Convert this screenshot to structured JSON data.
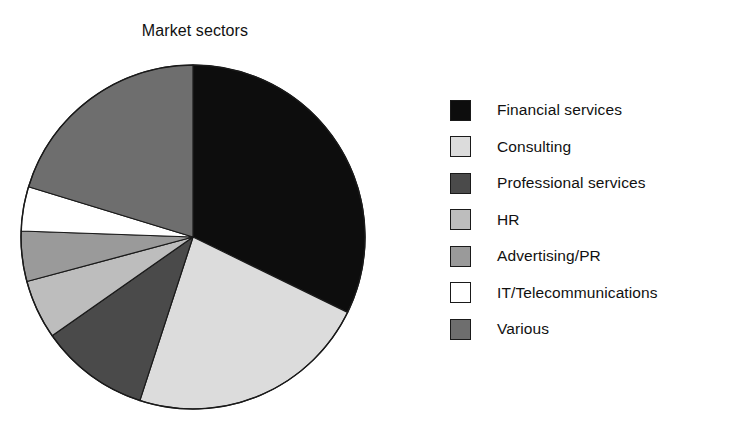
{
  "chart_data": {
    "type": "pie",
    "title": "Market sectors",
    "xlabel": "",
    "ylabel": "",
    "legend_position": "right",
    "grid": false,
    "start_angle_deg": 0,
    "direction": "clockwise",
    "categories": [
      "Financial services",
      "Consulting",
      "Professional services",
      "HR",
      "Advertising/PR",
      "IT/Telecommunications",
      "Various"
    ],
    "values": [
      32.2,
      22.8,
      10.3,
      5.6,
      4.7,
      4.2,
      20.2
    ],
    "slice_colors": [
      "#0d0d0d",
      "#dcdcdc",
      "#4a4a4a",
      "#bdbdbd",
      "#9a9a9a",
      "#ffffff",
      "#6e6e6e"
    ],
    "slices": [
      {
        "label": "Financial services",
        "value": 32.2,
        "start_deg": 0,
        "end_deg": 116,
        "color": "#0d0d0d"
      },
      {
        "label": "Consulting",
        "value": 22.8,
        "start_deg": 116,
        "end_deg": 198,
        "color": "#dcdcdc"
      },
      {
        "label": "Professional services",
        "value": 10.3,
        "start_deg": 198,
        "end_deg": 235,
        "color": "#4a4a4a"
      },
      {
        "label": "HR",
        "value": 5.6,
        "start_deg": 235,
        "end_deg": 255,
        "color": "#bdbdbd"
      },
      {
        "label": "Advertising/PR",
        "value": 4.7,
        "start_deg": 255,
        "end_deg": 272,
        "color": "#9a9a9a"
      },
      {
        "label": "IT/Telecommunications",
        "value": 4.2,
        "start_deg": 272,
        "end_deg": 287,
        "color": "#ffffff"
      },
      {
        "label": "Various",
        "value": 20.2,
        "start_deg": 287,
        "end_deg": 360,
        "color": "#6e6e6e"
      }
    ]
  },
  "legend": {
    "items": [
      {
        "label": "Financial services",
        "color": "#0d0d0d"
      },
      {
        "label": "Consulting",
        "color": "#dcdcdc"
      },
      {
        "label": "Professional services",
        "color": "#4a4a4a"
      },
      {
        "label": "HR",
        "color": "#bdbdbd"
      },
      {
        "label": "Advertising/PR",
        "color": "#9a9a9a"
      },
      {
        "label": "IT/Telecommunications",
        "color": "#ffffff"
      },
      {
        "label": "Various",
        "color": "#6e6e6e"
      }
    ]
  },
  "style": {
    "background": "#ffffff",
    "outline": "#1a1a1a",
    "text": "#111111"
  }
}
